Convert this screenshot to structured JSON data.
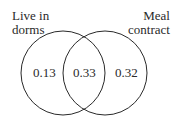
{
  "diagram": {
    "type": "venn",
    "sets": [
      {
        "label_line1": "Live in",
        "label_line2": "dorms",
        "only_value": "0.13"
      },
      {
        "label_line1": "Meal",
        "label_line2": "contract",
        "only_value": "0.32"
      }
    ],
    "intersection_value": "0.33",
    "stroke_color": "#2a2a2a"
  }
}
